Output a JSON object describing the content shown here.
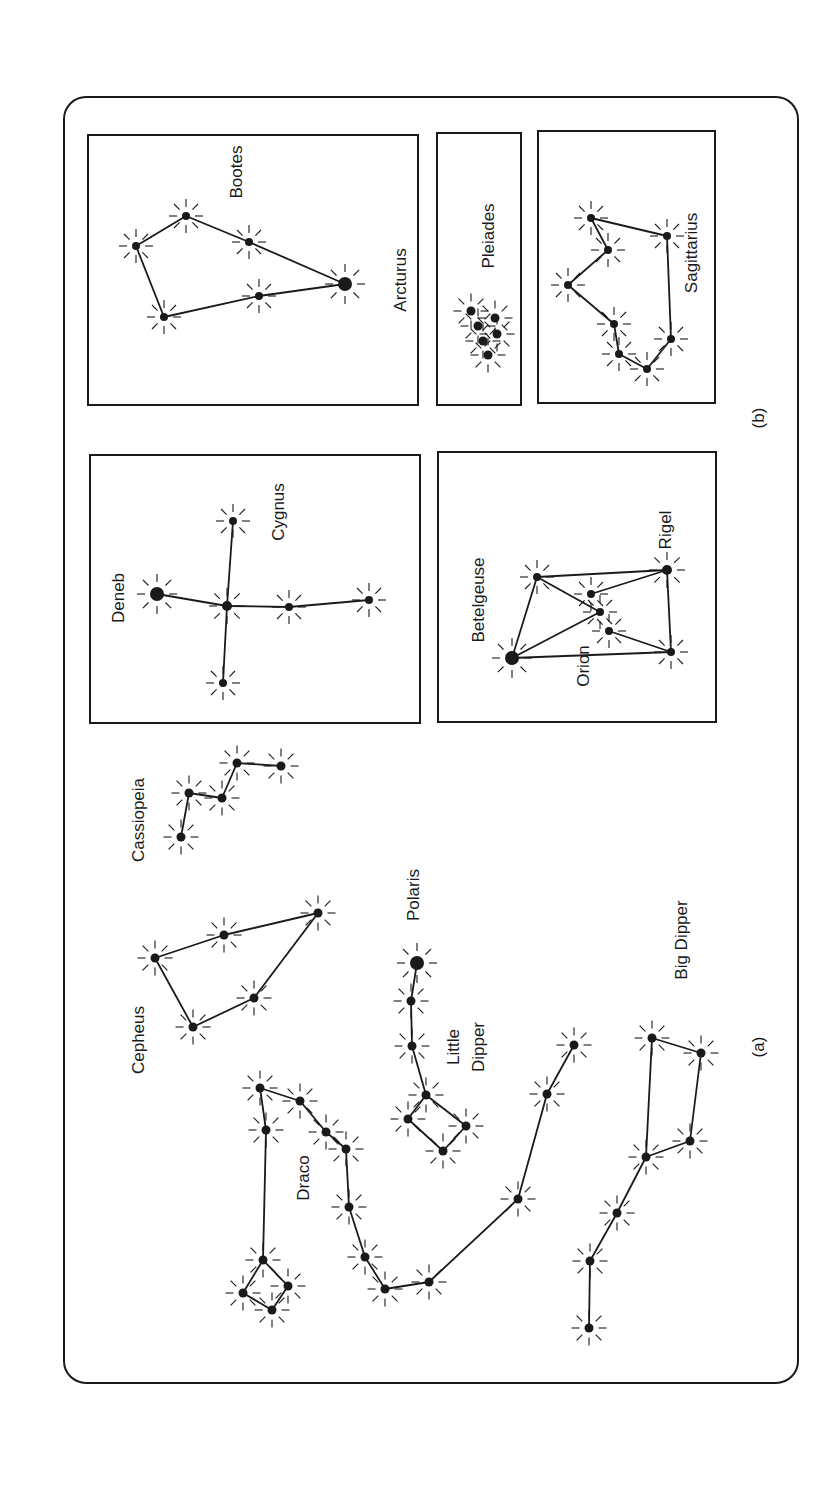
{
  "figure": {
    "frame": {
      "x": 64,
      "y": 97,
      "w": 734,
      "h": 1286,
      "r": 22
    },
    "ink": "#1a1a1a",
    "part_labels": [
      {
        "id": "b",
        "text": "(b)",
        "x": 760,
        "y": 418
      },
      {
        "id": "a",
        "text": "(a)",
        "x": 760,
        "y": 1047
      }
    ]
  },
  "panels": [
    {
      "name": "bootes-panel",
      "x": 88,
      "y": 135,
      "w": 330,
      "h": 270
    },
    {
      "name": "pleiades-panel",
      "x": 437,
      "y": 133,
      "w": 84,
      "h": 272
    },
    {
      "name": "sagittarius-panel",
      "x": 538,
      "y": 131,
      "w": 177,
      "h": 272
    },
    {
      "name": "cygnus-panel",
      "x": 90,
      "y": 455,
      "w": 330,
      "h": 268
    },
    {
      "name": "orion-panel",
      "x": 438,
      "y": 452,
      "w": 278,
      "h": 270
    }
  ],
  "constellations": [
    {
      "name": "Bootes",
      "labels": [
        {
          "text": "Bootes",
          "x": 238,
          "y": 172
        },
        {
          "text": "Arcturus",
          "x": 402,
          "y": 280
        }
      ],
      "stars": [
        [
          136,
          246,
          4
        ],
        [
          186,
          216,
          4
        ],
        [
          249,
          242,
          4
        ],
        [
          345,
          284,
          7
        ],
        [
          259,
          296,
          4
        ],
        [
          164,
          317,
          4
        ]
      ],
      "lines": [
        [
          0,
          1
        ],
        [
          1,
          2
        ],
        [
          2,
          3
        ],
        [
          3,
          4
        ],
        [
          4,
          5
        ],
        [
          5,
          0
        ]
      ]
    },
    {
      "name": "Pleiades",
      "labels": [
        {
          "text": "Pleiades",
          "x": 490,
          "y": 236
        }
      ],
      "stars": [
        [
          471,
          311,
          4.5
        ],
        [
          478,
          326,
          4.5
        ],
        [
          483,
          341,
          4.5
        ],
        [
          488,
          355,
          4.5
        ],
        [
          495,
          318,
          4.5
        ],
        [
          497,
          334,
          4.5
        ]
      ],
      "lines": []
    },
    {
      "name": "Sagittarius",
      "labels": [
        {
          "text": "Sagittarius",
          "x": 693,
          "y": 253
        }
      ],
      "stars": [
        [
          591,
          218,
          4
        ],
        [
          608,
          250,
          4
        ],
        [
          568,
          285,
          4
        ],
        [
          614,
          324,
          4
        ],
        [
          619,
          354,
          4
        ],
        [
          647,
          369,
          4
        ],
        [
          671,
          339,
          4
        ],
        [
          667,
          236,
          4
        ]
      ],
      "lines": [
        [
          0,
          1
        ],
        [
          1,
          2
        ],
        [
          2,
          3
        ],
        [
          3,
          4
        ],
        [
          4,
          5
        ],
        [
          5,
          6
        ],
        [
          6,
          7
        ],
        [
          7,
          0
        ]
      ]
    },
    {
      "name": "Cygnus",
      "labels": [
        {
          "text": "Cygnus",
          "x": 280,
          "y": 512
        },
        {
          "text": "Deneb",
          "x": 120,
          "y": 598
        }
      ],
      "stars": [
        [
          157,
          594,
          7
        ],
        [
          227,
          606,
          5
        ],
        [
          233,
          521,
          4
        ],
        [
          289,
          607,
          4
        ],
        [
          369,
          600,
          4
        ],
        [
          223,
          683,
          4
        ]
      ],
      "lines": [
        [
          0,
          1
        ],
        [
          1,
          3
        ],
        [
          3,
          4
        ],
        [
          1,
          2
        ],
        [
          1,
          5
        ]
      ]
    },
    {
      "name": "Orion",
      "labels": [
        {
          "text": "Betelgeuse",
          "x": 480,
          "y": 600
        },
        {
          "text": "Orion",
          "x": 585,
          "y": 666
        },
        {
          "text": "Rigel",
          "x": 667,
          "y": 530
        }
      ],
      "stars": [
        [
          512,
          658,
          7
        ],
        [
          537,
          577,
          4
        ],
        [
          667,
          570,
          5
        ],
        [
          671,
          652,
          4
        ],
        [
          591,
          594,
          4
        ],
        [
          600,
          612,
          4
        ],
        [
          609,
          631,
          4
        ]
      ],
      "lines": [
        [
          0,
          1
        ],
        [
          1,
          2
        ],
        [
          2,
          3
        ],
        [
          3,
          0
        ],
        [
          1,
          5
        ],
        [
          5,
          0
        ],
        [
          4,
          2
        ],
        [
          6,
          3
        ]
      ]
    },
    {
      "name": "Cassiopeia",
      "labels": [
        {
          "text": "Cassiopeia",
          "x": 140,
          "y": 820
        }
      ],
      "stars": [
        [
          181,
          837,
          4.5
        ],
        [
          189,
          793,
          4.5
        ],
        [
          222,
          798,
          4.5
        ],
        [
          237,
          763,
          4.5
        ],
        [
          281,
          766,
          4.5
        ]
      ],
      "lines": [
        [
          0,
          1
        ],
        [
          1,
          2
        ],
        [
          2,
          3
        ],
        [
          3,
          4
        ]
      ]
    },
    {
      "name": "Cepheus",
      "labels": [
        {
          "text": "Cepheus",
          "x": 140,
          "y": 1040
        }
      ],
      "stars": [
        [
          155,
          958,
          4.5
        ],
        [
          224,
          935,
          4.5
        ],
        [
          318,
          913,
          4.5
        ],
        [
          254,
          998,
          4.5
        ],
        [
          193,
          1027,
          4.5
        ]
      ],
      "lines": [
        [
          0,
          1
        ],
        [
          1,
          2
        ],
        [
          2,
          3
        ],
        [
          3,
          4
        ],
        [
          4,
          0
        ]
      ]
    },
    {
      "name": "Little Dipper",
      "labels": [
        {
          "text": "Polaris",
          "x": 415,
          "y": 895
        },
        {
          "text": "Little",
          "x": 455,
          "y": 1047
        },
        {
          "text": "Dipper",
          "x": 480,
          "y": 1047
        }
      ],
      "stars": [
        [
          417,
          963,
          7
        ],
        [
          411,
          1001,
          4.5
        ],
        [
          412,
          1046,
          4.5
        ],
        [
          426,
          1095,
          4.5
        ],
        [
          408,
          1119,
          4.5
        ],
        [
          443,
          1151,
          4.5
        ],
        [
          466,
          1126,
          4.5
        ]
      ],
      "lines": [
        [
          0,
          1
        ],
        [
          1,
          2
        ],
        [
          2,
          3
        ],
        [
          3,
          4
        ],
        [
          4,
          5
        ],
        [
          5,
          6
        ],
        [
          6,
          3
        ]
      ]
    },
    {
      "name": "Draco",
      "labels": [
        {
          "text": "Draco",
          "x": 305,
          "y": 1178
        }
      ],
      "stars": [
        [
          574,
          1045,
          4.5
        ],
        [
          547,
          1094,
          4.5
        ],
        [
          518,
          1199,
          4.5
        ],
        [
          429,
          1282,
          4.5
        ],
        [
          385,
          1289,
          4.5
        ],
        [
          365,
          1257,
          4.5
        ],
        [
          349,
          1207,
          4.5
        ],
        [
          346,
          1149,
          4.5
        ],
        [
          326,
          1132,
          4.5
        ],
        [
          300,
          1101,
          4.5
        ],
        [
          260,
          1088,
          4.5
        ],
        [
          266,
          1130,
          4.5
        ],
        [
          263,
          1260,
          4.5
        ],
        [
          243,
          1293,
          4.5
        ],
        [
          272,
          1310,
          4.5
        ],
        [
          288,
          1286,
          4.5
        ]
      ],
      "lines": [
        [
          0,
          1
        ],
        [
          1,
          2
        ],
        [
          2,
          3
        ],
        [
          3,
          4
        ],
        [
          4,
          5
        ],
        [
          5,
          6
        ],
        [
          6,
          7
        ],
        [
          7,
          8
        ],
        [
          8,
          9
        ],
        [
          9,
          10
        ],
        [
          10,
          11
        ],
        [
          11,
          12
        ],
        [
          12,
          13
        ],
        [
          13,
          14
        ],
        [
          14,
          15
        ],
        [
          15,
          12
        ]
      ]
    },
    {
      "name": "Big Dipper",
      "labels": [
        {
          "text": "Big Dipper",
          "x": 683,
          "y": 940
        }
      ],
      "stars": [
        [
          652,
          1038,
          4.5
        ],
        [
          701,
          1053,
          4.5
        ],
        [
          690,
          1141,
          4.5
        ],
        [
          646,
          1157,
          4.5
        ],
        [
          617,
          1213,
          4.5
        ],
        [
          590,
          1261,
          4.5
        ],
        [
          589,
          1328,
          4.5
        ]
      ],
      "lines": [
        [
          0,
          1
        ],
        [
          1,
          2
        ],
        [
          2,
          3
        ],
        [
          3,
          0
        ],
        [
          3,
          4
        ],
        [
          4,
          5
        ],
        [
          5,
          6
        ]
      ]
    }
  ]
}
